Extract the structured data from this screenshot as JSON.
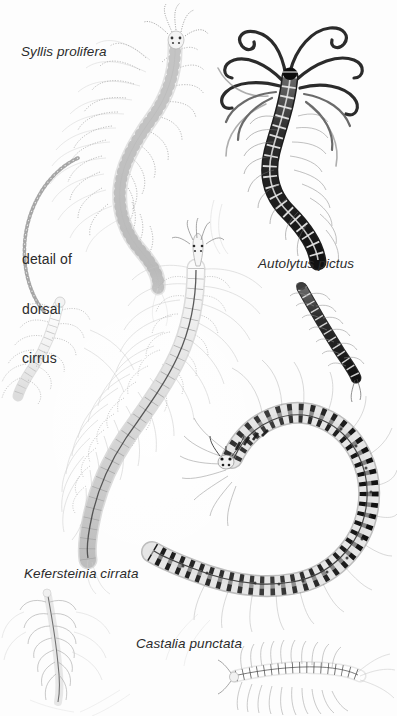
{
  "plate": {
    "title": "Marine polychaete worms illustration plate",
    "background_color": "#fdfdfd",
    "ink_color": "#2b2b2b",
    "width": 397,
    "height": 716
  },
  "labels": {
    "syllis": "Syllis prolifera",
    "detail_line1": "detail of",
    "detail_line2": "dorsal",
    "detail_line3": "cirrus",
    "autolytus": "Autolytus pictus",
    "kefersteinia": "Kefersteinia cirrata",
    "castalia": "Castalia punctata"
  },
  "specimens": [
    {
      "name": "Syllis prolifera",
      "position": "top-left",
      "tone": "pale-grey",
      "description": "Long S-curved segmented worm with beaded dorsal cirri, head with two pairs of eyes at upper right"
    },
    {
      "name": "dorsal cirrus detail",
      "position": "left-margin",
      "tone": "pale-grey",
      "description": "Enlarged beaded moniliform cirrus arc drawn along the left margin"
    },
    {
      "name": "Autolytus pictus",
      "position": "top-right",
      "tone": "dark-black",
      "description": "Dark banded worm with long curling coiled tentacles radiating from the head"
    },
    {
      "name": "Autolytus pictus juvenile",
      "position": "right-middle",
      "tone": "dark-grey",
      "description": "Short dark banded segment body with small lateral parapodia"
    },
    {
      "name": "Kefersteinia cirrata",
      "position": "center",
      "tone": "light-grey",
      "description": "Large pale curved segmented worm with long fine cirri and a dark dorsal midline"
    },
    {
      "name": "Kefersteinia cirrata detail",
      "position": "mid-left",
      "tone": "pale-grey",
      "description": "Small pale anterior fragment with beaded cirri"
    },
    {
      "name": "Kefersteinia cirrata juvenile",
      "position": "bottom-left",
      "tone": "faint-grey",
      "description": "Faint slender worm with fine hair-like chaetae"
    },
    {
      "name": "Castalia punctata",
      "position": "bottom-right",
      "tone": "dark-banded",
      "description": "Large horseshoe-curved worm with strong dark transverse bands and long trailing cirri"
    },
    {
      "name": "Castalia punctata juvenile",
      "position": "bottom-center",
      "tone": "pale-grey",
      "description": "Small pale ladder-like segmented worm with radiating chaetae"
    }
  ]
}
